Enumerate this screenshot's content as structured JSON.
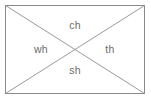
{
  "diagram": {
    "type": "rectangle-with-diagonals",
    "colors": {
      "background": "#ffffff",
      "border": "#8a8a8a",
      "diagonal": "#9a9a9a",
      "text": "#6b6b6b"
    },
    "frame": {
      "x": 5,
      "y": 5,
      "width": 140,
      "height": 89
    },
    "center": {
      "x": 75,
      "y": 49
    },
    "regions": [
      {
        "position": "top",
        "label": "ch"
      },
      {
        "position": "left",
        "label": "wh"
      },
      {
        "position": "right",
        "label": "th"
      },
      {
        "position": "bottom",
        "label": "sh"
      }
    ]
  }
}
